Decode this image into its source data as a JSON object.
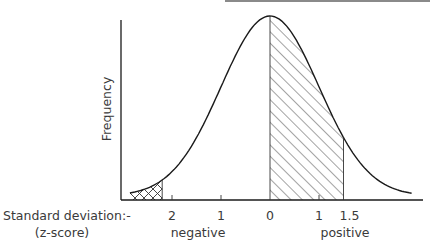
{
  "chart_data": {
    "type": "area",
    "title": "",
    "ylabel": "Frequency",
    "xlabel": "Standard deviation:-",
    "xlabel_sub": "(z-score)",
    "x_ticks": [
      {
        "z": -2,
        "label": "2"
      },
      {
        "z": -1,
        "label": "1"
      },
      {
        "z": 0,
        "label": "0"
      },
      {
        "z": 1,
        "label": "1"
      },
      {
        "z": 1.5,
        "label": "1.5"
      }
    ],
    "side_labels": {
      "negative": "negative",
      "positive": "positive"
    },
    "curve": {
      "mean": 0,
      "sd": 1,
      "x_range": [
        -2.86,
        2.9
      ]
    },
    "shaded_regions": [
      {
        "from": 0,
        "to": 1.5,
        "pattern": "diagonal-hatch"
      },
      {
        "from": -2.86,
        "to": -2.2,
        "pattern": "cross-hatch"
      }
    ],
    "grid": false,
    "legend": null
  },
  "colors": {
    "line": "#1a1a1a",
    "text": "#3a3a3a",
    "top_rule": "#8a8a8a"
  }
}
